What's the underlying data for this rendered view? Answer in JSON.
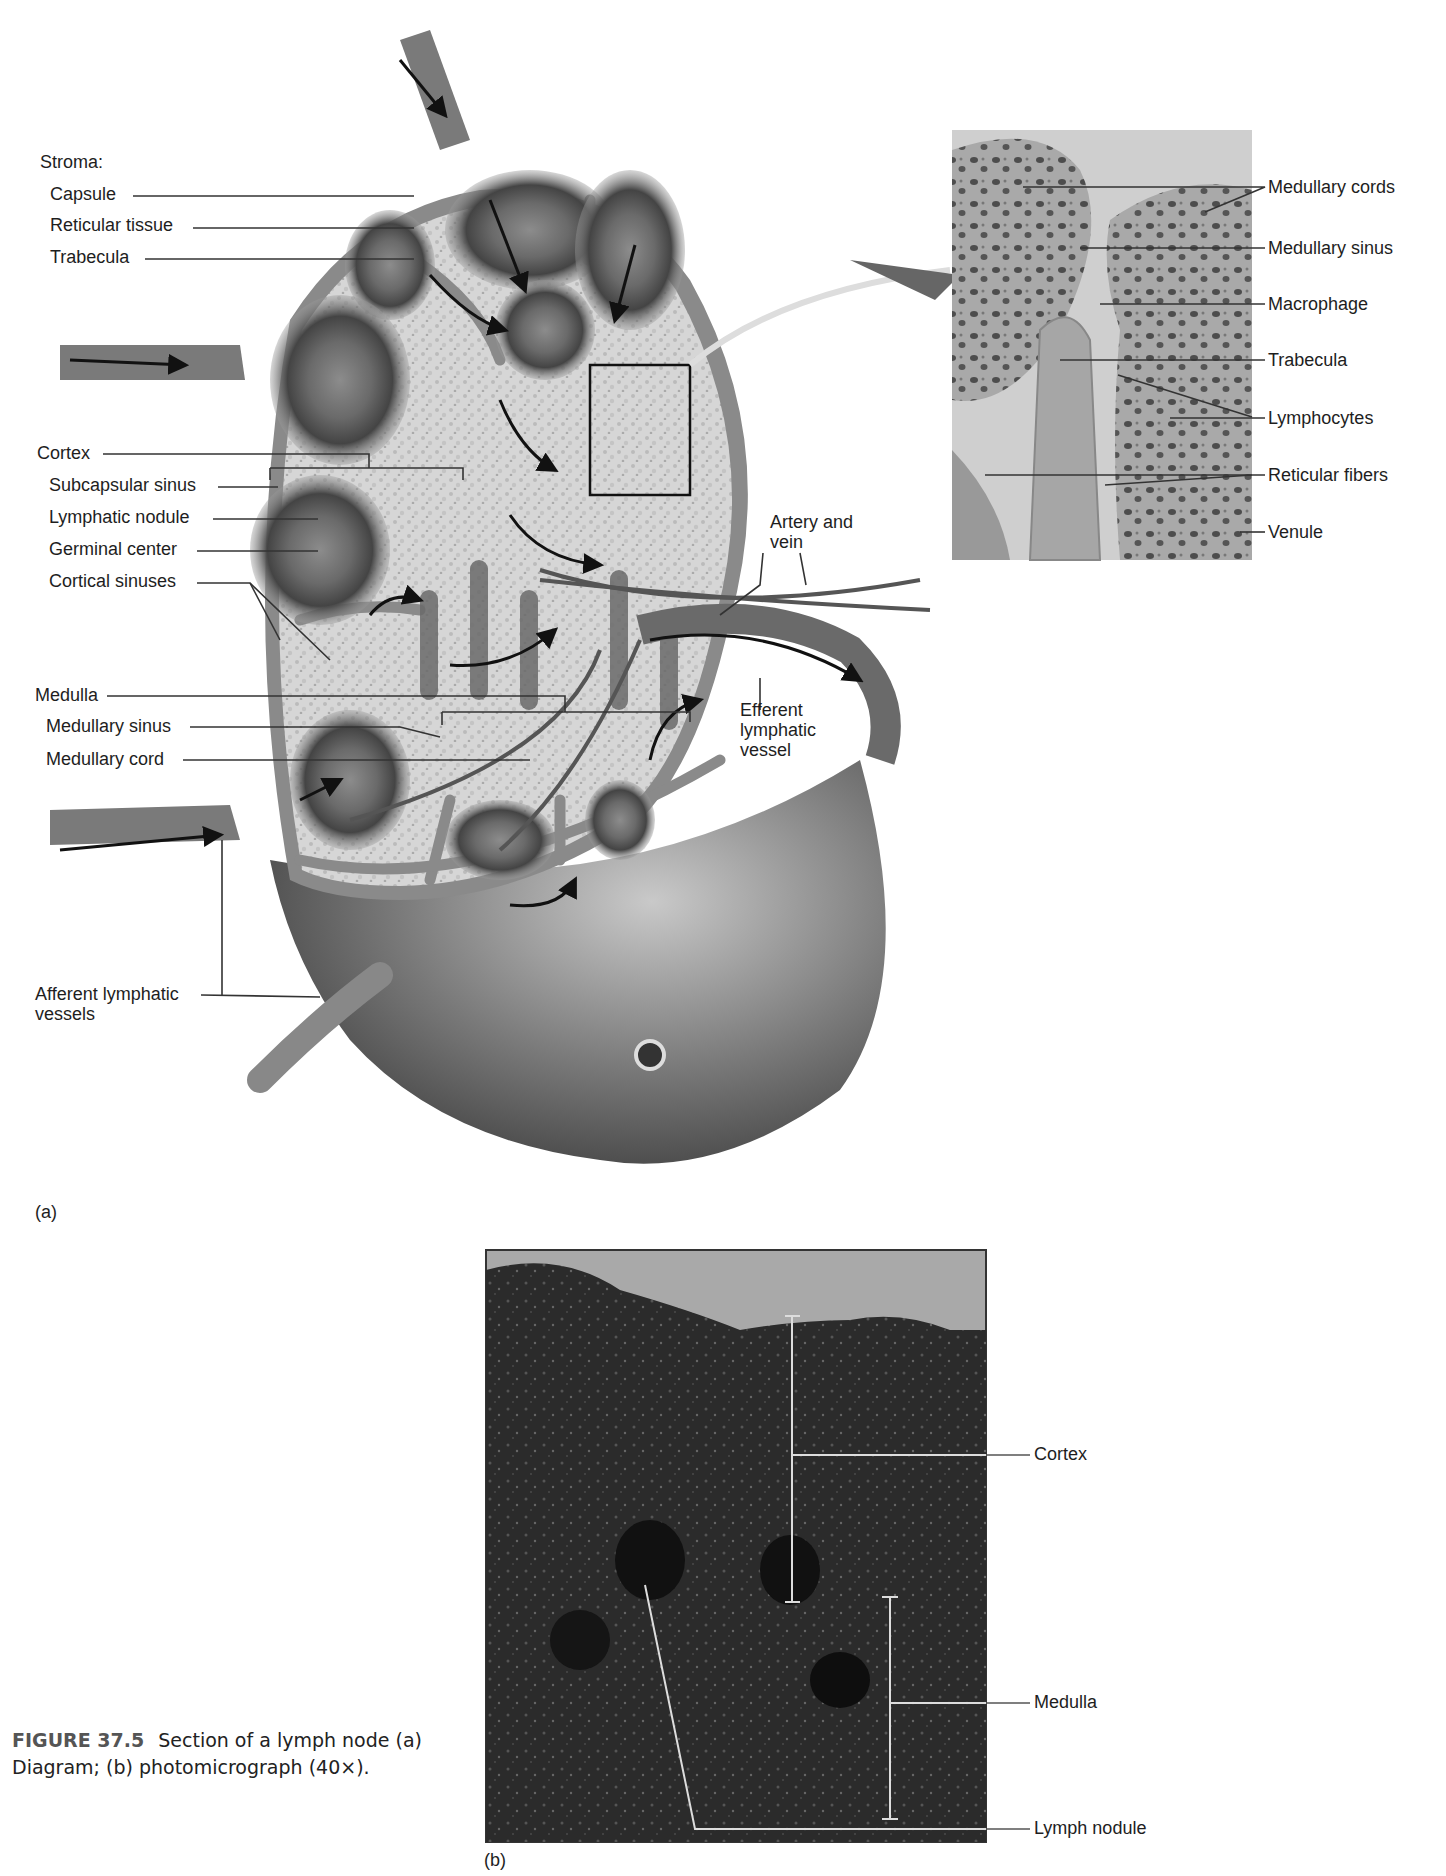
{
  "figure": {
    "number": "FIGURE 37.5",
    "title": "Section of a lymph node",
    "description": "(a) Diagram; (b) photomicrograph (40×).",
    "panel_a_tag": "(a)",
    "panel_b_tag": "(b)"
  },
  "diagram_a": {
    "stroma_heading": "Stroma:",
    "stroma_labels": [
      "Capsule",
      "Reticular tissue",
      "Trabecula"
    ],
    "cortex_heading": "Cortex",
    "cortex_labels": [
      "Subcapsular sinus",
      "Lymphatic nodule",
      "Germinal center",
      "Cortical sinuses"
    ],
    "medulla_heading": "Medulla",
    "medulla_labels": [
      "Medullary sinus",
      "Medullary cord"
    ],
    "afferent_label": "Afferent lymphatic vessels",
    "artery_vein_label": "Artery and vein",
    "efferent_label": "Efferent lymphatic vessel"
  },
  "inset": {
    "labels": [
      "Medullary cords",
      "Medullary sinus",
      "Macrophage",
      "Trabecula",
      "Lymphocytes",
      "Reticular fibers",
      "Venule"
    ]
  },
  "micrograph_b": {
    "labels": [
      "Cortex",
      "Medulla",
      "Lymph nodule"
    ]
  },
  "colors": {
    "capsule": "#8a8a8a",
    "reticular": "#d4d4d4",
    "nodule_dark": "#4a4a4a",
    "node_body": "#6e6e6e",
    "micrograph_dark": "#2a2a2a",
    "leader_line": "#333333"
  }
}
